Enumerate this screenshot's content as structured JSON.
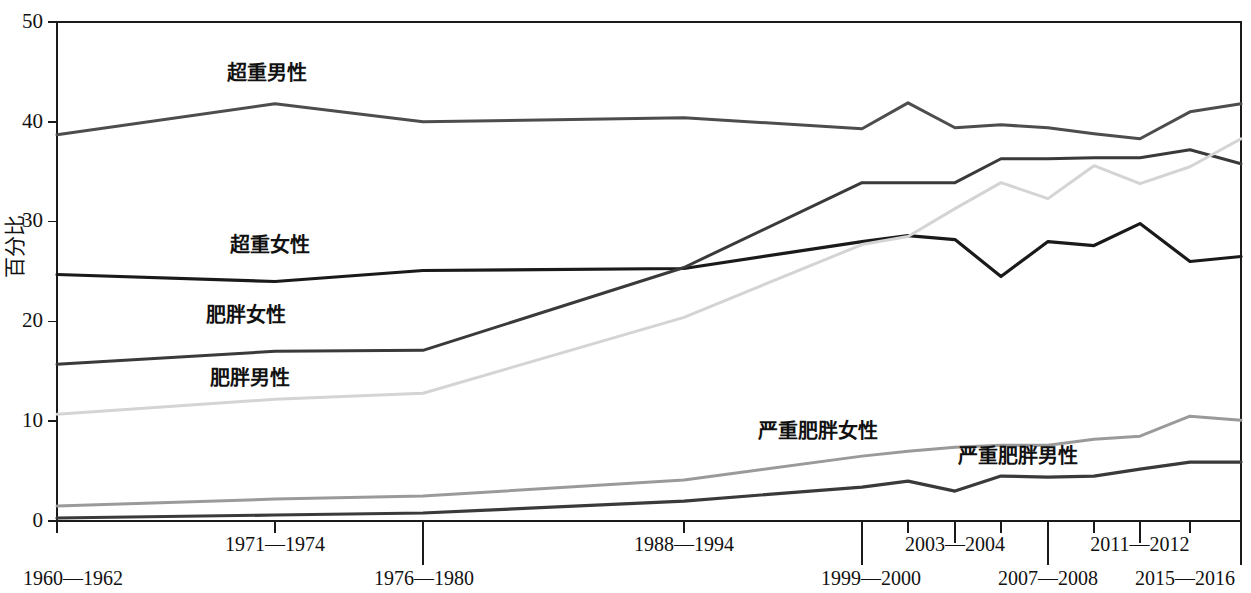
{
  "chart_data": {
    "type": "line",
    "title": "",
    "subtitle": "",
    "xlabel": "",
    "ylabel": "百分比",
    "ylim": [
      0,
      50
    ],
    "yticks": [
      0,
      10,
      20,
      30,
      40,
      50
    ],
    "ytick_labels": [
      "0",
      "10",
      "20",
      "30",
      "40",
      "50"
    ],
    "grid": false,
    "legend_position": "inline-annotations",
    "x": [
      "1960—1962",
      "1971—1974",
      "1976—1980",
      "1988—1994",
      "1999—2000",
      "2001—2002",
      "2003—2004",
      "2005—2006",
      "2007—2008",
      "2009—2010",
      "2011—2012",
      "2013—2014",
      "2015—2016"
    ],
    "xtick_labels_row1": [
      "1971—1974",
      "1988—1994",
      "2003—2004",
      "2011—2012"
    ],
    "xtick_labels_row2": [
      "1960—1962",
      "1976—1980",
      "1999—2000",
      "2007—2008",
      "2015—2016"
    ],
    "series": [
      {
        "name": "超重男性",
        "color": "#4d4d4d",
        "width": 3.0,
        "values": [
          38.7,
          41.8,
          40.0,
          40.4,
          39.3,
          41.9,
          39.4,
          39.7,
          39.4,
          38.8,
          38.3,
          41.0,
          41.8
        ]
      },
      {
        "name": "超重女性",
        "color": "#1a1a1a",
        "width": 3.2,
        "values": [
          24.7,
          24.0,
          25.1,
          25.3,
          28.0,
          28.6,
          28.2,
          24.5,
          28.0,
          27.6,
          29.8,
          26.0,
          26.5
        ]
      },
      {
        "name": "肥胖女性",
        "color": "#3a3a3a",
        "width": 3.0,
        "values": [
          15.7,
          17.0,
          17.1,
          25.4,
          33.9,
          33.9,
          33.9,
          36.3,
          36.3,
          36.4,
          36.4,
          37.2,
          35.8
        ]
      },
      {
        "name": "肥胖男性",
        "color": "#d4d4d4",
        "width": 3.0,
        "values": [
          10.7,
          12.2,
          12.8,
          20.4,
          27.7,
          28.5,
          31.3,
          33.9,
          32.3,
          35.6,
          33.8,
          35.5,
          38.3
        ]
      },
      {
        "name": "严重肥胖女性",
        "color": "#9a9a9a",
        "width": 3.0,
        "values": [
          1.5,
          2.2,
          2.5,
          4.1,
          6.5,
          7.0,
          7.4,
          7.6,
          7.6,
          8.2,
          8.5,
          10.5,
          10.1
        ]
      },
      {
        "name": "严重肥胖男性",
        "color": "#3a3a3a",
        "width": 3.2,
        "values": [
          0.3,
          0.6,
          0.8,
          2.0,
          3.4,
          4.0,
          3.0,
          4.5,
          4.4,
          4.5,
          5.2,
          5.9,
          5.9
        ]
      }
    ],
    "annotations": [
      {
        "text": "超重男性",
        "x_px": 267,
        "y_px": 80
      },
      {
        "text": "超重女性",
        "x_px": 270,
        "y_px": 252
      },
      {
        "text": "肥胖女性",
        "x_px": 246,
        "y_px": 322
      },
      {
        "text": "肥胖男性",
        "x_px": 250,
        "y_px": 385
      },
      {
        "text": "严重肥胖女性",
        "x_px": 818,
        "y_px": 438
      },
      {
        "text": "严重肥胖男性",
        "x_px": 1018,
        "y_px": 463
      }
    ]
  }
}
